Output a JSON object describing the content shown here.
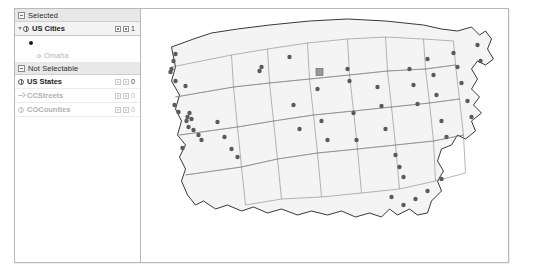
{
  "tree": {
    "groups": [
      {
        "id": "selected",
        "label": "Selected",
        "icon": "collapse-expander-icon",
        "rows": [
          {
            "id": "us-cities",
            "label": "US Cities",
            "icon": "globe-layer-icon",
            "expander": "triangle-open-icon",
            "count": "1",
            "enabled": true,
            "checkbox_a": "visible-checkbox",
            "checkbox_b": "selectable-checkbox",
            "symbol": {
              "name": "point-symbol-swatch",
              "shape": "filled-dot",
              "color": "#1a1a1a"
            },
            "features": [
              {
                "id": "omaha",
                "label": "Omaha",
                "icon": "point-feature-icon"
              }
            ]
          }
        ]
      },
      {
        "id": "not-selectable",
        "label": "Not Selectable",
        "icon": "collapse-expander-icon",
        "rows": [
          {
            "id": "us-states",
            "label": "US States",
            "icon": "globe-layer-icon",
            "expander": "none",
            "count": "0",
            "enabled": true,
            "checkbox_a": "visible-checkbox",
            "checkbox_b": "selectable-checkbox",
            "features": []
          },
          {
            "id": "ccstreets",
            "label": "CCStreets",
            "icon": "arrow-layer-icon",
            "expander": "none",
            "count": "0",
            "enabled": false,
            "checkbox_a": "visible-checkbox",
            "checkbox_b": "selectable-checkbox",
            "features": []
          },
          {
            "id": "cocounties",
            "label": "COCounties",
            "icon": "globe-layer-icon",
            "expander": "none",
            "count": "0",
            "enabled": false,
            "checkbox_a": "visible-checkbox",
            "checkbox_b": "selectable-checkbox",
            "features": []
          }
        ]
      }
    ]
  },
  "map": {
    "name": "us-states-map",
    "fill": "#f4f4f4",
    "stroke": "#7a7a7a",
    "city_marker_color": "#5a5a5a",
    "selected_marker_color": "#9a9a9a",
    "selected_city": "Omaha",
    "cities": [
      [
        34,
        45
      ],
      [
        32,
        52
      ],
      [
        30,
        60
      ],
      [
        29,
        63
      ],
      [
        34,
        72
      ],
      [
        44,
        77
      ],
      [
        33,
        96
      ],
      [
        37,
        103
      ],
      [
        48,
        104
      ],
      [
        46,
        108
      ],
      [
        50,
        110
      ],
      [
        45,
        112
      ],
      [
        47,
        118
      ],
      [
        52,
        121
      ],
      [
        57,
        126
      ],
      [
        60,
        131
      ],
      [
        41,
        139
      ],
      [
        76,
        113
      ],
      [
        83,
        128
      ],
      [
        90,
        140
      ],
      [
        96,
        148
      ],
      [
        118,
        62
      ],
      [
        120,
        58
      ],
      [
        148,
        48
      ],
      [
        152,
        96
      ],
      [
        158,
        120
      ],
      [
        176,
        80
      ],
      [
        180,
        112
      ],
      [
        186,
        131
      ],
      [
        206,
        60
      ],
      [
        208,
        72
      ],
      [
        212,
        104
      ],
      [
        215,
        131
      ],
      [
        236,
        78
      ],
      [
        240,
        97
      ],
      [
        244,
        120
      ],
      [
        254,
        146
      ],
      [
        258,
        158
      ],
      [
        262,
        168
      ],
      [
        268,
        60
      ],
      [
        272,
        76
      ],
      [
        276,
        95
      ],
      [
        286,
        50
      ],
      [
        292,
        66
      ],
      [
        295,
        86
      ],
      [
        300,
        112
      ],
      [
        305,
        128
      ],
      [
        312,
        44
      ],
      [
        316,
        58
      ],
      [
        320,
        74
      ],
      [
        326,
        92
      ],
      [
        330,
        108
      ],
      [
        336,
        36
      ],
      [
        339,
        52
      ],
      [
        300,
        170
      ],
      [
        286,
        182
      ],
      [
        274,
        190
      ],
      [
        262,
        196
      ],
      [
        250,
        188
      ]
    ],
    "selected_marker": {
      "x": 178,
      "y": 63,
      "size": 7
    }
  }
}
